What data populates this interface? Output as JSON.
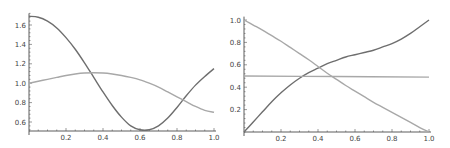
{
  "chart_data": [
    {
      "type": "line",
      "title": "",
      "xlabel": "",
      "ylabel": "",
      "xlim": [
        0,
        1.0
      ],
      "ylim": [
        0.52,
        1.72
      ],
      "x_ticks": [
        0.2,
        0.4,
        0.6,
        0.8,
        1.0
      ],
      "x_tick_labels": [
        "0.2",
        "0.4",
        "0.6",
        "0.8",
        "1.0"
      ],
      "y_ticks": [
        0.6,
        0.8,
        1.0,
        1.2,
        1.4,
        1.6
      ],
      "y_tick_labels": [
        "0.6",
        "0.8",
        "1.0",
        "1.2",
        "1.4",
        "1.6"
      ],
      "grid": false,
      "legend": "none",
      "series": [
        {
          "name": "dark",
          "color": "#6e6e6e",
          "x": [
            0,
            0.05,
            0.1,
            0.15,
            0.2,
            0.25,
            0.3,
            0.35,
            0.4,
            0.45,
            0.5,
            0.55,
            0.6,
            0.65,
            0.7,
            0.75,
            0.8,
            0.85,
            0.9,
            0.95,
            1.0
          ],
          "values": [
            1.69,
            1.68,
            1.64,
            1.57,
            1.47,
            1.35,
            1.21,
            1.06,
            0.91,
            0.77,
            0.65,
            0.56,
            0.52,
            0.52,
            0.56,
            0.64,
            0.75,
            0.87,
            0.98,
            1.07,
            1.15
          ]
        },
        {
          "name": "light",
          "color": "#a8a8a8",
          "x": [
            0,
            0.05,
            0.1,
            0.15,
            0.2,
            0.25,
            0.3,
            0.35,
            0.4,
            0.45,
            0.5,
            0.55,
            0.6,
            0.65,
            0.7,
            0.75,
            0.8,
            0.85,
            0.9,
            0.95,
            1.0
          ],
          "values": [
            1.0,
            1.02,
            1.04,
            1.06,
            1.08,
            1.095,
            1.105,
            1.108,
            1.105,
            1.095,
            1.08,
            1.06,
            1.035,
            1.0,
            0.96,
            0.91,
            0.86,
            0.81,
            0.76,
            0.72,
            0.7
          ]
        }
      ]
    },
    {
      "type": "line",
      "title": "",
      "xlabel": "",
      "ylabel": "",
      "xlim": [
        0,
        1.0
      ],
      "ylim": [
        0,
        1.03
      ],
      "x_ticks": [
        0.2,
        0.4,
        0.6,
        0.8,
        1.0
      ],
      "x_tick_labels": [
        "0.2",
        "0.4",
        "0.6",
        "0.8",
        "1.0"
      ],
      "y_ticks": [
        0.2,
        0.4,
        0.6,
        0.8,
        1.0
      ],
      "y_tick_labels": [
        "0.2",
        "0.4",
        "0.6",
        "0.8",
        "1.0"
      ],
      "grid": false,
      "legend": "none",
      "series": [
        {
          "name": "dark",
          "color": "#6e6e6e",
          "x": [
            0,
            0.05,
            0.1,
            0.15,
            0.2,
            0.25,
            0.3,
            0.35,
            0.4,
            0.45,
            0.5,
            0.55,
            0.6,
            0.65,
            0.7,
            0.75,
            0.8,
            0.85,
            0.9,
            0.95,
            1.0
          ],
          "values": [
            0.0,
            0.09,
            0.18,
            0.27,
            0.35,
            0.42,
            0.48,
            0.53,
            0.57,
            0.61,
            0.64,
            0.67,
            0.69,
            0.71,
            0.73,
            0.76,
            0.79,
            0.83,
            0.88,
            0.94,
            1.0
          ]
        },
        {
          "name": "light-descending",
          "color": "#a8a8a8",
          "x": [
            0,
            0.05,
            0.1,
            0.15,
            0.2,
            0.25,
            0.3,
            0.35,
            0.4,
            0.45,
            0.5,
            0.55,
            0.6,
            0.65,
            0.7,
            0.75,
            0.8,
            0.85,
            0.9,
            0.95,
            1.0
          ],
          "values": [
            1.0,
            0.955,
            0.91,
            0.86,
            0.81,
            0.755,
            0.7,
            0.645,
            0.585,
            0.525,
            0.47,
            0.415,
            0.365,
            0.315,
            0.265,
            0.22,
            0.175,
            0.13,
            0.085,
            0.04,
            0.0
          ]
        },
        {
          "name": "light-flat",
          "color": "#a8a8a8",
          "x": [
            0,
            0.5,
            1.0
          ],
          "values": [
            0.5,
            0.495,
            0.49
          ]
        }
      ]
    }
  ]
}
